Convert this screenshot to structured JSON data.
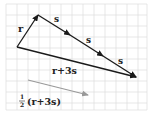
{
  "diagram": {
    "grid": {
      "color": "#dcdcdc",
      "spacing": 11
    },
    "vectors": [
      {
        "name": "r",
        "label": "r",
        "color": "#1a1a1a"
      },
      {
        "name": "s1",
        "label": "s",
        "color": "#1a1a1a"
      },
      {
        "name": "s2",
        "label": "s",
        "color": "#1a1a1a"
      },
      {
        "name": "s3",
        "label": "s",
        "color": "#1a1a1a"
      },
      {
        "name": "r_plus_3s",
        "label": "r+3s",
        "color": "#1a1a1a"
      },
      {
        "name": "half_r_plus_3s",
        "label_prefix": "1/2",
        "label_frac_num": "1",
        "label_frac_den": "2",
        "label": "(r+3s)",
        "color": "#999999"
      }
    ]
  }
}
